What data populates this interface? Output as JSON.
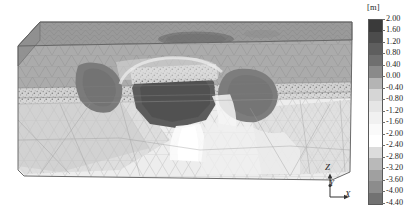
{
  "figure": {
    "title": "",
    "background_color": "#ffffff"
  },
  "legend": {
    "unit_label": "[m]",
    "quantity": "displacement",
    "position": "right",
    "tick_labels": [
      "2.00",
      "1.60",
      "1.20",
      "0.80",
      "0.40",
      "0.00",
      "-0.40",
      "-0.80",
      "-1.20",
      "-1.60",
      "-2.00",
      "-2.40",
      "-2.80",
      "-3.20",
      "-3.60",
      "-4.00",
      "-4.40"
    ],
    "band_colors": [
      "#3a3a3a",
      "#4c4c4c",
      "#5e5e5e",
      "#6f6f6f",
      "#8a8a8a",
      "#b4b4b4",
      "#d6d6d6",
      "#e6e6e6",
      "#f1f1f1",
      "#fafafa",
      "#ffffff",
      "#dcdcdc",
      "#b9b9b9",
      "#a0a0a0",
      "#8c8c8c",
      "#727272"
    ]
  },
  "axis_triad": {
    "z_label": "Z",
    "y_label": "Y",
    "x_label": "X"
  },
  "model": {
    "description": "3D tetrahedral finite-element mesh block with displacement contours",
    "surface_base_color": "#9a9a9a",
    "front_face_color": "#b6b6b6",
    "edge_color": "#6e6e6e"
  },
  "chart_data": {
    "type": "heatmap",
    "title": "",
    "subtitle": "",
    "xlabel": "X",
    "ylabel": "Z",
    "zlabel": "Y",
    "colorbar_label": "[m]",
    "colorbar_unit": "m",
    "grid": false,
    "legend_position": "right",
    "scale_min": -4.4,
    "scale_max": 2.0,
    "scale_step": 0.4,
    "n_bands": 16,
    "tick_values": [
      2.0,
      1.6,
      1.2,
      0.8,
      0.4,
      0.0,
      -0.4,
      -0.8,
      -1.2,
      -1.6,
      -2.0,
      -2.4,
      -2.8,
      -3.2,
      -3.6,
      -4.0,
      -4.4
    ],
    "colormap": "grayscale",
    "regions": [
      {
        "name": "top-surface",
        "value": 0.4,
        "color": "#9a9a9a"
      },
      {
        "name": "surface-settlement-trough",
        "value": -3.6,
        "color": "#7b7b7b"
      },
      {
        "name": "upper-front-face",
        "value": 0.0,
        "color": "#a8a8a8"
      },
      {
        "name": "left-lobe-void",
        "value": -3.6,
        "color": "#7a7a7a"
      },
      {
        "name": "right-lobe-void",
        "value": -3.6,
        "color": "#7d7d7d"
      },
      {
        "name": "central-excavation-core",
        "value": -4.2,
        "color": "#5d5d5d"
      },
      {
        "name": "lower-body",
        "value": -1.6,
        "color": "#cfcfcf"
      },
      {
        "name": "base-region",
        "value": -2.0,
        "color": "#e8e8e8"
      }
    ]
  }
}
